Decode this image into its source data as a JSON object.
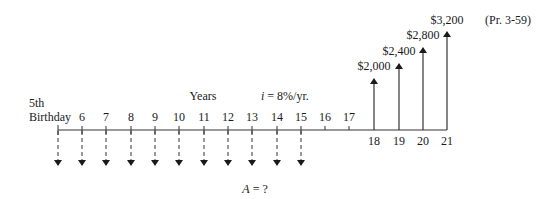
{
  "diagram": {
    "type": "cash-flow-diagram",
    "start_label_line1": "5th",
    "start_label_line2": "Birthday",
    "axis_title": "Years",
    "interest_rate": "i = 8%/yr.",
    "interest_symbol": "i",
    "interest_value": " = 8%/yr.",
    "problem_ref": "(Pr. 3-59)",
    "annuity_label": "A = ?",
    "annuity_symbol": "A",
    "annuity_value": " = ?",
    "ticks_above": [
      "6",
      "7",
      "8",
      "9",
      "10",
      "11",
      "12",
      "13",
      "14",
      "15",
      "16",
      "17"
    ],
    "ticks_below": [
      "18",
      "19",
      "20",
      "21"
    ],
    "withdrawals": [
      "5",
      "6",
      "7",
      "8",
      "9",
      "10",
      "11",
      "12",
      "13",
      "14",
      "15"
    ],
    "receipts": [
      {
        "year": "18",
        "amount": "$2,000"
      },
      {
        "year": "19",
        "amount": "$2,400"
      },
      {
        "year": "20",
        "amount": "$2,800"
      },
      {
        "year": "21",
        "amount": "$3,200"
      }
    ]
  }
}
